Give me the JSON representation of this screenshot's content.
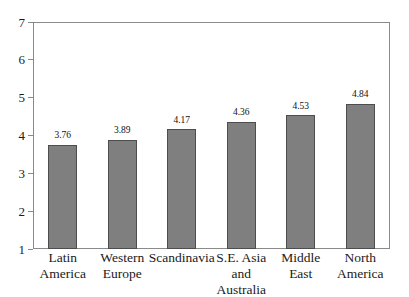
{
  "chart_data": {
    "type": "bar",
    "title": "",
    "subtitle": "",
    "xlabel": "",
    "ylabel": "",
    "categories": [
      "Latin America",
      "Western Europe",
      "Scandinavia",
      "S.E. Asia and Australia",
      "Middle East",
      "North America"
    ],
    "values": [
      3.76,
      3.89,
      4.17,
      4.36,
      4.53,
      4.84
    ],
    "value_labels": [
      "3.76",
      "3.89",
      "4.17",
      "4.36",
      "4.53",
      "4.84"
    ],
    "ylim": [
      1,
      7
    ],
    "ytick_labels": [
      "1",
      "2",
      "3",
      "4",
      "5",
      "6",
      "7"
    ],
    "yticks": [
      1,
      2,
      3,
      4,
      5,
      6,
      7
    ],
    "grid": false,
    "legend": "none",
    "bar_color": "#7f7f7f",
    "bar_border_color": "#4d4d4d",
    "frame_color": "#8a8a8a",
    "background_color": "#ffffff",
    "text_color": "#1a1a1a"
  },
  "axis": {
    "y_tick_labels": [
      "7",
      "6",
      "5",
      "4",
      "3",
      "2",
      "1"
    ]
  },
  "x_category_lines": [
    [
      "Latin",
      "America"
    ],
    [
      "Western",
      "Europe"
    ],
    [
      "Scandinavia",
      ""
    ],
    [
      "S.E. Asia",
      "and Australia"
    ],
    [
      "Middle",
      "East"
    ],
    [
      "North",
      "America"
    ]
  ]
}
